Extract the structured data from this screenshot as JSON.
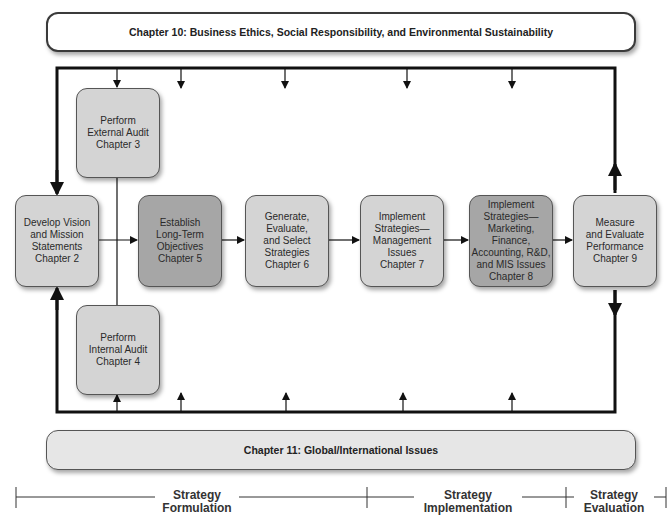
{
  "top_banner": {
    "label": "Chapter 10: Business Ethics, Social Responsibility, and Environmental Sustainability"
  },
  "bottom_banner": {
    "label": "Chapter 11:  Global/International Issues"
  },
  "boxes": {
    "external_audit": {
      "label": "Perform\nExternal Audit\nChapter 3"
    },
    "internal_audit": {
      "label": "Perform\nInternal Audit\nChapter 4"
    },
    "vision_mission": {
      "label": "Develop Vision\nand Mission\nStatements\nChapter 2"
    },
    "objectives": {
      "label": "Establish\nLong-Term\nObjectives\nChapter 5"
    },
    "generate_strategies": {
      "label": "Generate,\nEvaluate,\nand Select\nStrategies\nChapter 6"
    },
    "implement_management": {
      "label": "Implement\nStrategies—\nManagement\nIssues\nChapter 7"
    },
    "implement_marketing": {
      "label": "Implement\nStrategies—\nMarketing,\nFinance,\nAccounting, R&D,\nand MIS Issues\nChapter 8"
    },
    "measure_evaluate": {
      "label": "Measure\nand Evaluate\nPerformance\nChapter 9"
    }
  },
  "timeline": {
    "formulation": "Strategy\nFormulation",
    "implementation": "Strategy\nImplementation",
    "evaluation": "Strategy\nEvaluation"
  },
  "colors": {
    "light_box": "#d4d4d4",
    "dark_box": "#a6a6a6",
    "line": "#111111"
  }
}
